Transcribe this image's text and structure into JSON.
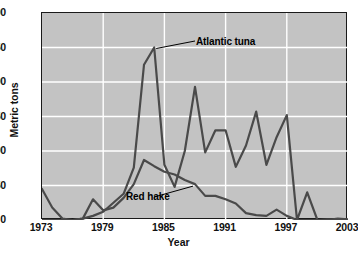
{
  "chart_data": {
    "type": "line",
    "title": "",
    "xlabel": "Year",
    "ylabel": "Metric tons",
    "xlim": [
      1973,
      2003
    ],
    "ylim": [
      0,
      300
    ],
    "ytick_values": [
      0,
      50,
      100,
      150,
      200,
      250,
      300
    ],
    "ytick_labels": [
      "0",
      "50",
      "100",
      "150",
      "200",
      "250",
      "300"
    ],
    "xtick_values": [
      1973,
      1979,
      1985,
      1991,
      1997,
      2003
    ],
    "xtick_labels": [
      "1973",
      "1979",
      "1985",
      "1991",
      "1997",
      "2003"
    ],
    "grid": true,
    "grid_color": "#ffffff",
    "plot_background": "#c3c3c3",
    "line_color": "#4a4a4a",
    "legend_position": "inline-annotations",
    "x": [
      1973,
      1974,
      1975,
      1976,
      1977,
      1978,
      1979,
      1980,
      1981,
      1982,
      1983,
      1984,
      1985,
      1986,
      1987,
      1988,
      1989,
      1990,
      1991,
      1992,
      1993,
      1994,
      1995,
      1996,
      1997,
      1998,
      1999,
      2000,
      2001,
      2002,
      2003
    ],
    "series": [
      {
        "name": "Atlantic tuna",
        "annotation": "Atlantic tuna",
        "values": [
          0,
          0,
          0,
          0,
          2,
          6,
          12,
          25,
          38,
          76,
          225,
          250,
          80,
          48,
          100,
          193,
          98,
          130,
          130,
          77,
          108,
          157,
          80,
          120,
          152,
          0,
          40,
          0,
          0,
          2,
          1
        ]
      },
      {
        "name": "Red hake",
        "annotation": "Red hake",
        "values": [
          45,
          18,
          2,
          0,
          2,
          30,
          14,
          18,
          32,
          52,
          87,
          78,
          70,
          66,
          58,
          52,
          35,
          35,
          30,
          24,
          10,
          7,
          6,
          15,
          6,
          0,
          0,
          0,
          1,
          0,
          0
        ]
      }
    ],
    "annotations": [
      {
        "text": "Atlantic tuna",
        "points_to_year": 1984,
        "points_to_value": 250
      },
      {
        "text": "Red hake",
        "points_to_year": 1988,
        "points_to_value": 52
      }
    ]
  }
}
